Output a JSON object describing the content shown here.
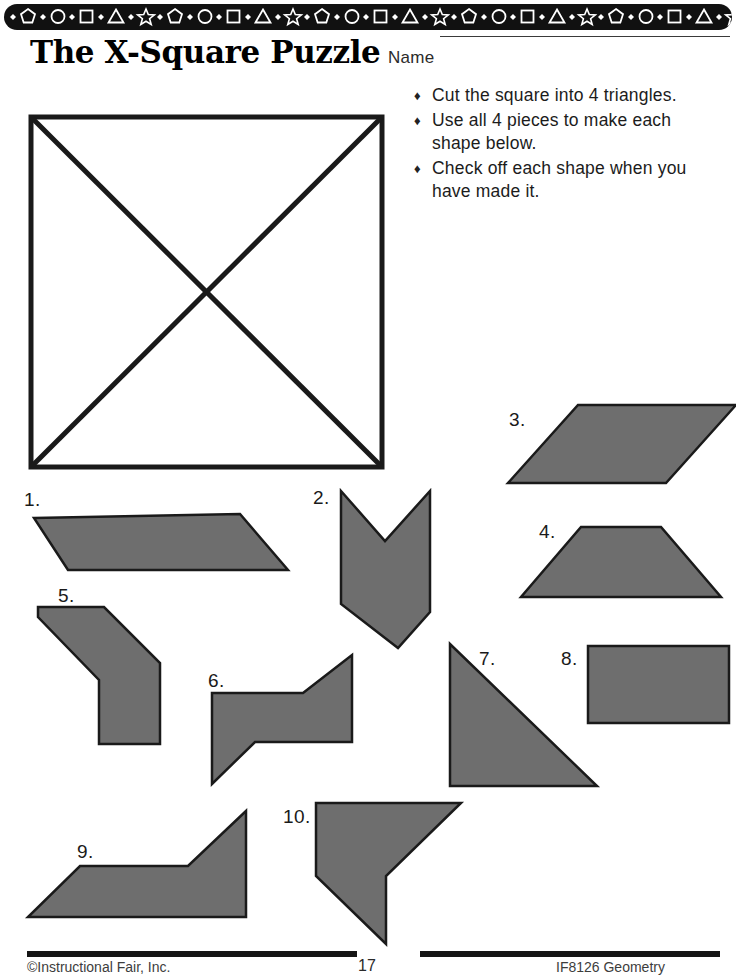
{
  "document": {
    "title": "The X-Square Puzzle",
    "name_label": "Name",
    "name_value": ""
  },
  "banner": {
    "background_color": "#111111",
    "shape_color": "#ffffff",
    "sequence": [
      "diamond",
      "pentagon",
      "diamond",
      "circle",
      "diamond",
      "square",
      "diamond",
      "triangle",
      "diamond",
      "star"
    ],
    "repeats": 5
  },
  "instructions": {
    "bullet_glyph": "♦",
    "items": [
      "Cut the square into 4 triangles.",
      "Use all 4 pieces to make each shape below.",
      "Check off each shape when you have made it."
    ]
  },
  "colors": {
    "shape_fill": "#6e6e6e",
    "shape_stroke": "#1a1a1a",
    "ink": "#1a1a1a",
    "paper": "#ffffff"
  },
  "master_square": {
    "label": "x-square-with-diagonals",
    "x": 31,
    "y": 117,
    "width": 351,
    "height": 350,
    "stroke_width": 5,
    "diagonals": 2
  },
  "shapes": [
    {
      "number": "1.",
      "name": "parallelogram-leaning-right",
      "label_x": 24,
      "label_y": 489,
      "points": "34,518 240,514 288,570 68,570"
    },
    {
      "number": "2.",
      "name": "downward-chevron-arrow",
      "label_x": 313,
      "label_y": 487,
      "points": "341,491 341,604 398,648 430,612 430,491 385,541"
    },
    {
      "number": "3.",
      "name": "parallelogram-leaning-right-upper",
      "label_x": 509,
      "label_y": 409,
      "points": "578,405 736,405 666,483 508,483"
    },
    {
      "number": "4.",
      "name": "trapezoid",
      "label_x": 539,
      "label_y": 521,
      "points": "581,527 661,527 721,597 521,597"
    },
    {
      "number": "5.",
      "name": "boot-polygon",
      "label_x": 58,
      "label_y": 585,
      "points": "38,607 104,607 160,663 160,744 99,744 99,680 38,617"
    },
    {
      "number": "6.",
      "name": "zigzag-polygon",
      "label_x": 208,
      "label_y": 670,
      "points": "212,693 303,693 352,655 352,742 255,742 212,784"
    },
    {
      "number": "7.",
      "name": "right-triangle",
      "label_x": 479,
      "label_y": 648,
      "points": "450,644 450,786 597,786"
    },
    {
      "number": "8.",
      "name": "rectangle",
      "label_x": 561,
      "label_y": 648,
      "points": "588,646 729,646 729,723 588,723"
    },
    {
      "number": "9.",
      "name": "notched-trapezoid",
      "label_x": 77,
      "label_y": 841,
      "points": "80,866 188,866 246,811 246,917 28,917"
    },
    {
      "number": "10.",
      "name": "flag-polygon",
      "label_x": 283,
      "label_y": 806,
      "points": "316,803 461,803 386,876 386,944 316,876"
    }
  ],
  "footer": {
    "left_text": "©Instructional Fair, Inc.",
    "page_number": "17",
    "right_text": "IF8126 Geometry"
  }
}
